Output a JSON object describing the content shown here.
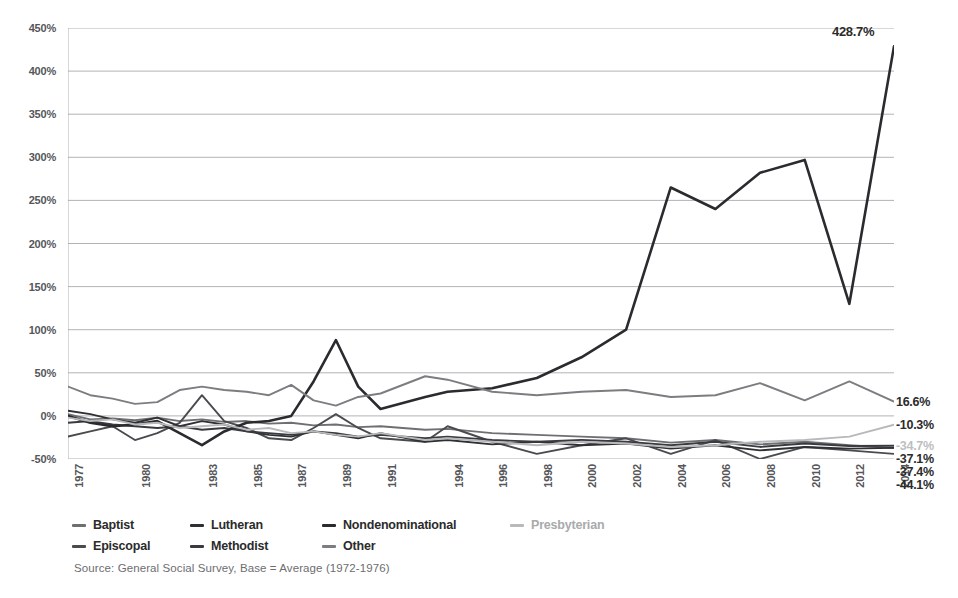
{
  "chart_data": {
    "type": "line",
    "title": "",
    "subtitle": "",
    "xlabel": "",
    "ylabel": "",
    "ylim": [
      -50,
      450
    ],
    "ytick_values": [
      450,
      400,
      350,
      300,
      250,
      200,
      150,
      100,
      50,
      0,
      -50
    ],
    "ytick_labels": [
      "450%",
      "400%",
      "350%",
      "300%",
      "250%",
      "200%",
      "150%",
      "100%",
      "50%",
      "0%",
      "-50%"
    ],
    "grid": true,
    "legend_position": "bottom-left",
    "x": [
      1977,
      1978,
      1979,
      1980,
      1981,
      1982,
      1983,
      1984,
      1985,
      1986,
      1987,
      1988,
      1989,
      1990,
      1991,
      1993,
      1994,
      1996,
      1998,
      2000,
      2002,
      2004,
      2006,
      2008,
      2010,
      2012,
      2014
    ],
    "xtick_values": [
      1977,
      1980,
      1983,
      1985,
      1987,
      1989,
      1991,
      1994,
      1996,
      1998,
      2000,
      2002,
      2004,
      2006,
      2008,
      2010,
      2012,
      2014
    ],
    "xtick_labels": [
      "1977",
      "1980",
      "1983",
      "1985",
      "1987",
      "1989",
      "1991",
      "1994",
      "1996",
      "1998",
      "2000",
      "2002",
      "2004",
      "2006",
      "2008",
      "2010",
      "2012",
      "2014"
    ],
    "series": [
      {
        "name": "Baptist",
        "color": "#6e6f73",
        "end_value_label": "-37.4%",
        "values": [
          2,
          -4,
          -3,
          -5,
          -2,
          -6,
          -4,
          -7,
          -6,
          -9,
          -8,
          -11,
          -10,
          -13,
          -12,
          -16,
          -15,
          -20,
          -22,
          -24,
          -26,
          -31,
          -28,
          -33,
          -30,
          -34,
          -37.4
        ]
      },
      {
        "name": "Episcopal",
        "color": "#4a4b4f",
        "end_value_label": "-44.1%",
        "values": [
          -24,
          -18,
          -12,
          -28,
          -20,
          -8,
          24,
          -6,
          -14,
          -26,
          -28,
          -14,
          2,
          -14,
          -26,
          -30,
          -12,
          -30,
          -44,
          -34,
          -26,
          -44,
          -28,
          -50,
          -36,
          -40,
          -44.1
        ]
      },
      {
        "name": "Lutheran",
        "color": "#2f3033",
        "end_value_label": "-37.1%",
        "values": [
          6,
          2,
          -4,
          -8,
          -2,
          -12,
          -6,
          -10,
          -18,
          -22,
          -24,
          -18,
          -22,
          -26,
          -20,
          -30,
          -28,
          -33,
          -30,
          -34,
          -32,
          -38,
          -34,
          -40,
          -36,
          -38,
          -37.1
        ]
      },
      {
        "name": "Methodist",
        "color": "#3a3b40",
        "end_value_label": "-34.7%",
        "values": [
          -8,
          -6,
          -10,
          -12,
          -14,
          -12,
          -16,
          -14,
          -18,
          -20,
          -22,
          -18,
          -20,
          -24,
          -22,
          -26,
          -24,
          -28,
          -30,
          -28,
          -30,
          -34,
          -30,
          -36,
          -32,
          -35,
          -34.7
        ]
      },
      {
        "name": "Nondenominational",
        "color": "#2a2b2e",
        "end_value_label": "428.7%",
        "values": [
          0,
          -8,
          -12,
          -10,
          -6,
          -20,
          -34,
          -18,
          -8,
          -6,
          0,
          40,
          88,
          34,
          8,
          22,
          28,
          32,
          44,
          68,
          100,
          265,
          240,
          282,
          297,
          130,
          428.7
        ]
      },
      {
        "name": "Presbyterian",
        "color": "#b8b9bb",
        "end_value_label": "-10.3%",
        "values": [
          -2,
          -6,
          -4,
          -10,
          -8,
          -14,
          -12,
          -10,
          -16,
          -14,
          -20,
          -18,
          -22,
          -24,
          -20,
          -28,
          -26,
          -30,
          -34,
          -30,
          -32,
          -36,
          -34,
          -30,
          -28,
          -24,
          -10.3
        ]
      },
      {
        "name": "Other",
        "color": "#7c7d80",
        "end_value_label": "16.6%",
        "values": [
          34,
          24,
          20,
          14,
          16,
          30,
          34,
          30,
          28,
          24,
          36,
          18,
          12,
          22,
          26,
          46,
          42,
          28,
          24,
          28,
          30,
          22,
          24,
          38,
          18,
          40,
          16.6
        ]
      }
    ],
    "annotations": [
      {
        "text": "428.7%",
        "x": 2014,
        "y": 428.7
      }
    ],
    "end_labels": [
      {
        "text": "16.6%",
        "value": 16.6,
        "color": "#2b2b2b"
      },
      {
        "text": "-10.3%",
        "value": -10.3,
        "color": "#2b2b2b"
      },
      {
        "text": "-34.7%",
        "value": -34.7,
        "color": "#bdbec0"
      },
      {
        "text": "-37.1%",
        "value": -37.1,
        "color": "#2b2b2b"
      },
      {
        "text": "-37.4%",
        "value": -37.4,
        "color": "#2b2b2b"
      },
      {
        "text": "-44.1%",
        "value": -44.1,
        "color": "#2b2b2b"
      }
    ],
    "source": "Source: General Social Survey, Base = Average (1972-1976)"
  },
  "legend": {
    "rows": [
      [
        {
          "label": "Baptist",
          "color": "#6e6f73"
        },
        {
          "label": "Lutheran",
          "color": "#2f3033"
        },
        {
          "label": "Nondenominational",
          "color": "#2a2b2e"
        },
        {
          "label": "Presbyterian",
          "color": "#b8b9bb"
        }
      ],
      [
        {
          "label": "Episcopal",
          "color": "#4a4b4f"
        },
        {
          "label": "Methodist",
          "color": "#3a3b40"
        },
        {
          "label": "Other",
          "color": "#7c7d80"
        }
      ]
    ]
  }
}
